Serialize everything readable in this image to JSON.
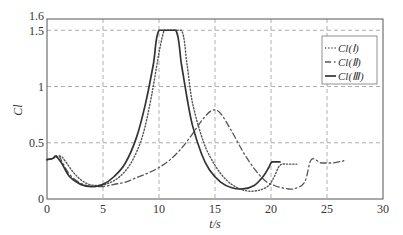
{
  "chart_data": {
    "type": "line",
    "title": "",
    "xlabel": "t/s",
    "ylabel": "Cl",
    "xlim": [
      0,
      30
    ],
    "ylim": [
      0,
      1.6
    ],
    "xticks": [
      0,
      5,
      10,
      15,
      20,
      25,
      30
    ],
    "yticks": [
      0,
      0.5,
      1,
      1.5,
      1.6
    ],
    "ytick_labels": [
      "0",
      "0.5",
      "1",
      "1.5",
      "1.6"
    ],
    "xtick_labels": [
      "0",
      "5",
      "10",
      "15",
      "20",
      "25",
      "30"
    ],
    "grid": true,
    "legend_position": "top-right",
    "series": [
      {
        "name": "Cl(Ⅰ)",
        "style": "dotted",
        "x": [
          0,
          0.5,
          1.2,
          1.6,
          2.5,
          3.5,
          4.5,
          5.5,
          6.5,
          7.5,
          8.5,
          9.3,
          10.0,
          10.4,
          10.6,
          12.0,
          12.5,
          13.0,
          14.0,
          15.0,
          16.0,
          17.0,
          18.0,
          19.0,
          19.8,
          20.3,
          20.8,
          21.5,
          22.3
        ],
        "y": [
          0.35,
          0.36,
          0.38,
          0.34,
          0.22,
          0.14,
          0.12,
          0.14,
          0.2,
          0.32,
          0.55,
          0.9,
          1.3,
          1.48,
          1.5,
          1.5,
          1.2,
          0.85,
          0.5,
          0.3,
          0.17,
          0.1,
          0.07,
          0.08,
          0.12,
          0.2,
          0.3,
          0.31,
          0.31
        ]
      },
      {
        "name": "Cl(Ⅱ)",
        "style": "dash-dot",
        "x": [
          0,
          0.5,
          1.0,
          1.3,
          2.0,
          3.0,
          4.0,
          5.0,
          6.0,
          7.0,
          8.0,
          9.0,
          10.0,
          11.0,
          12.0,
          13.0,
          14.0,
          14.8,
          15.5,
          16.5,
          17.5,
          18.5,
          19.5,
          20.3,
          21.0,
          22.0,
          23.0,
          23.6,
          24.5,
          25.5,
          26.5
        ],
        "y": [
          0.35,
          0.36,
          0.39,
          0.34,
          0.22,
          0.14,
          0.11,
          0.11,
          0.13,
          0.15,
          0.19,
          0.23,
          0.28,
          0.35,
          0.45,
          0.58,
          0.72,
          0.79,
          0.76,
          0.6,
          0.42,
          0.27,
          0.16,
          0.12,
          0.1,
          0.09,
          0.15,
          0.35,
          0.32,
          0.32,
          0.34
        ]
      },
      {
        "name": "Cl(Ⅲ)",
        "style": "solid",
        "x": [
          0,
          0.5,
          0.8,
          1.3,
          2.0,
          3.0,
          4.0,
          5.0,
          6.0,
          7.0,
          8.0,
          8.8,
          9.5,
          10.0,
          11.5,
          12.0,
          12.5,
          13.0,
          13.8,
          14.5,
          15.5,
          16.5,
          17.5,
          18.5,
          19.3,
          19.8,
          20.1,
          20.8
        ],
        "y": [
          0.35,
          0.36,
          0.38,
          0.32,
          0.2,
          0.13,
          0.11,
          0.13,
          0.2,
          0.32,
          0.55,
          0.85,
          1.2,
          1.5,
          1.5,
          1.2,
          0.9,
          0.65,
          0.4,
          0.26,
          0.15,
          0.1,
          0.09,
          0.12,
          0.2,
          0.28,
          0.33,
          0.33
        ]
      }
    ]
  }
}
